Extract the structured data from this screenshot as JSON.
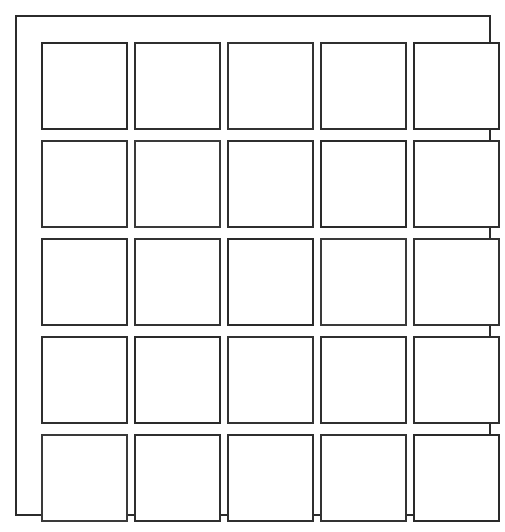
{
  "page": {
    "background_color": "#ffffff",
    "line_color": "#2f2f2f",
    "width": 505,
    "height": 532
  },
  "frame": {
    "name": "outer-border",
    "border_color": "#2b2b2b",
    "border_width": 2,
    "fill": "#ffffff"
  },
  "grid": {
    "rows": 5,
    "columns": 5,
    "total_cells": 25,
    "cell_fill": "#ffffff",
    "cell_border_color": "#2f2f2f",
    "cell_border_width": 2,
    "cells": [
      {
        "row": 1,
        "column": 1,
        "label": ""
      },
      {
        "row": 1,
        "column": 2,
        "label": ""
      },
      {
        "row": 1,
        "column": 3,
        "label": ""
      },
      {
        "row": 1,
        "column": 4,
        "label": ""
      },
      {
        "row": 1,
        "column": 5,
        "label": ""
      },
      {
        "row": 2,
        "column": 1,
        "label": ""
      },
      {
        "row": 2,
        "column": 2,
        "label": ""
      },
      {
        "row": 2,
        "column": 3,
        "label": ""
      },
      {
        "row": 2,
        "column": 4,
        "label": ""
      },
      {
        "row": 2,
        "column": 5,
        "label": ""
      },
      {
        "row": 3,
        "column": 1,
        "label": ""
      },
      {
        "row": 3,
        "column": 2,
        "label": ""
      },
      {
        "row": 3,
        "column": 3,
        "label": ""
      },
      {
        "row": 3,
        "column": 4,
        "label": ""
      },
      {
        "row": 3,
        "column": 5,
        "label": ""
      },
      {
        "row": 4,
        "column": 1,
        "label": ""
      },
      {
        "row": 4,
        "column": 2,
        "label": ""
      },
      {
        "row": 4,
        "column": 3,
        "label": ""
      },
      {
        "row": 4,
        "column": 4,
        "label": ""
      },
      {
        "row": 4,
        "column": 5,
        "label": ""
      },
      {
        "row": 5,
        "column": 1,
        "label": ""
      },
      {
        "row": 5,
        "column": 2,
        "label": ""
      },
      {
        "row": 5,
        "column": 3,
        "label": ""
      },
      {
        "row": 5,
        "column": 4,
        "label": ""
      },
      {
        "row": 5,
        "column": 5,
        "label": ""
      }
    ]
  }
}
